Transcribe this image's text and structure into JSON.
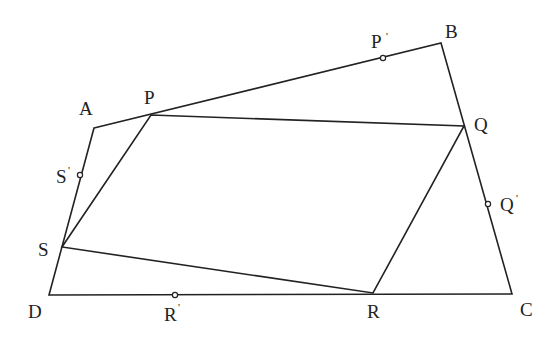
{
  "diagram": {
    "title": "",
    "outer_quadrilateral": {
      "name": "ABCD",
      "vertices": {
        "A": {
          "label": "A",
          "x": 94,
          "y": 128
        },
        "B": {
          "label": "B",
          "x": 441,
          "y": 43
        },
        "C": {
          "label": "C",
          "x": 512,
          "y": 294
        },
        "D": {
          "label": "D",
          "x": 49,
          "y": 295
        }
      }
    },
    "inner_quadrilateral": {
      "name": "PQRS",
      "vertices": {
        "P": {
          "label": "P",
          "x": 151,
          "y": 115
        },
        "Q": {
          "label": "Q",
          "x": 464,
          "y": 126
        },
        "R": {
          "label": "R",
          "x": 373,
          "y": 293
        },
        "S": {
          "label": "S",
          "x": 62,
          "y": 247
        }
      }
    },
    "midpoints": {
      "P_prime": {
        "label": "P",
        "prime": "'",
        "x": 383,
        "y": 58,
        "on_side": "AB"
      },
      "Q_prime": {
        "label": "Q",
        "prime": "'",
        "x": 488,
        "y": 204,
        "on_side": "BC"
      },
      "R_prime": {
        "label": "R",
        "prime": "'",
        "x": 175,
        "y": 295,
        "on_side": "CD"
      },
      "S_prime": {
        "label": "S",
        "prime": "'",
        "x": 80,
        "y": 175,
        "on_side": "DA"
      }
    },
    "colors": {
      "stroke": "#222222",
      "background": "#ffffff"
    }
  }
}
